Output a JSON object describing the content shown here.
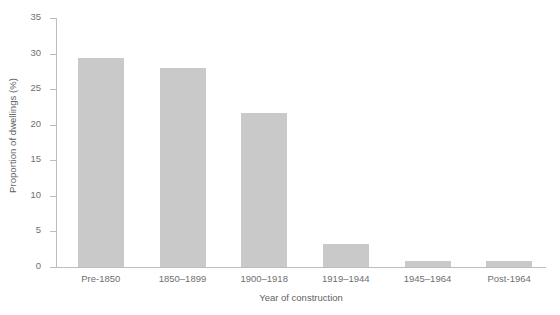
{
  "chart_data": {
    "type": "bar",
    "title": "",
    "subtitle": "",
    "xlabel": "Year of construction",
    "ylabel": "Proportion of dwellings (%)",
    "categories": [
      "Pre-1850",
      "1850–1899",
      "1900–1918",
      "1919–1944",
      "1945–1964",
      "Post-1964"
    ],
    "values": [
      29.4,
      28.0,
      21.6,
      3.2,
      0.8,
      0.8
    ],
    "ylim": [
      0,
      35
    ],
    "yticks": [
      0,
      5,
      10,
      15,
      20,
      25,
      30,
      35
    ],
    "ytick_labels": [
      "0",
      "5",
      "10",
      "15",
      "20",
      "25",
      "30",
      "35"
    ],
    "grid": false,
    "legend": null,
    "bar_color": "#c9c9c9",
    "axis_color": "#bdbdbd",
    "text_color": "#6f6f6f"
  }
}
